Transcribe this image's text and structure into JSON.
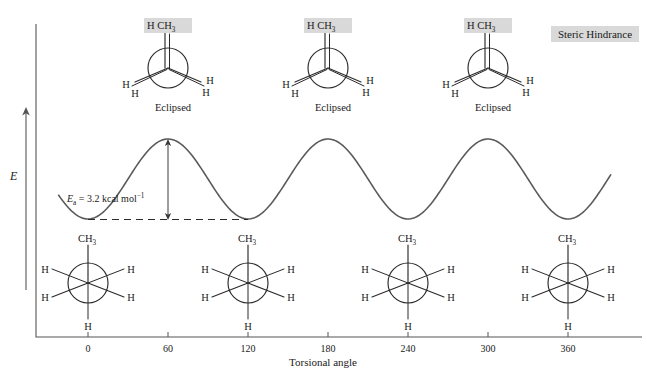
{
  "figure": {
    "title_label": "Steric Hindrance",
    "y_axis": {
      "label": "E"
    },
    "x_axis": {
      "label": "Torsional angle",
      "ticks": [
        "0",
        "60",
        "120",
        "180",
        "240",
        "300",
        "360"
      ],
      "tick_values": [
        0,
        60,
        120,
        180,
        240,
        300,
        360
      ]
    },
    "annotation": {
      "ea_italic": "E",
      "ea_sub": "a",
      "ea_text": " = 3.2 kcal mol",
      "ea_sup": "−1",
      "ea_full": "Ea = 3.2 kcal mol−1",
      "value": "3.2",
      "unit": "kcal mol−1"
    },
    "eclipsed": {
      "caption": "Eclipsed",
      "top_label_h": "H",
      "top_label_ch3": "CH",
      "top_label_ch3_sub": "3",
      "h_labels": [
        "H",
        "H",
        "H",
        "H"
      ],
      "at_angles": [
        60,
        180,
        300
      ]
    },
    "staggered": {
      "top_label_ch3": "CH",
      "top_label_ch3_sub": "3",
      "h_labels": [
        "H",
        "H",
        "H",
        "H",
        "H"
      ],
      "at_angles": [
        0,
        120,
        240,
        360
      ]
    },
    "colors": {
      "highlight": "#d9d9d9",
      "curve": "#5a5a5a",
      "axis": "#555555",
      "ink": "#1a1a1a"
    }
  },
  "chart_data": {
    "type": "line",
    "title": "Steric Hindrance",
    "xlabel": "Torsional angle",
    "ylabel": "E",
    "xlim": [
      -22,
      392
    ],
    "ylim": [
      0,
      3.2
    ],
    "grid": false,
    "legend": null,
    "annotations": [
      {
        "text": "Ea = 3.2 kcal mol−1",
        "x": 60,
        "y": 1.5
      },
      {
        "text": "Eclipsed",
        "x": 60,
        "y": 3.2
      },
      {
        "text": "Eclipsed",
        "x": 180,
        "y": 3.2
      },
      {
        "text": "Eclipsed",
        "x": 300,
        "y": 3.2
      }
    ],
    "x": [
      0,
      60,
      120,
      180,
      240,
      300,
      360
    ],
    "y": [
      0,
      3.2,
      0,
      3.2,
      0,
      3.2,
      0
    ],
    "maxima_x": [
      60,
      180,
      300
    ],
    "minima_x": [
      0,
      120,
      240,
      360
    ],
    "barrier_kcal_per_mol": 3.2
  }
}
